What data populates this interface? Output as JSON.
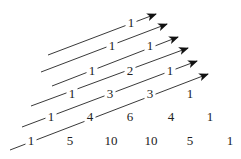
{
  "rows": [
    {
      "row": 0,
      "values": [
        "1"
      ]
    },
    {
      "row": 1,
      "values": [
        "1",
        "1"
      ]
    },
    {
      "row": 2,
      "values": [
        "1",
        "2",
        "1"
      ]
    },
    {
      "row": 3,
      "values": [
        "1",
        "3",
        "3",
        "1"
      ]
    },
    {
      "row": 4,
      "values": [
        "1",
        "4",
        "6",
        "4",
        "1"
      ]
    },
    {
      "row": 5,
      "values": [
        "1",
        "5",
        "10",
        "10",
        "5",
        "1"
      ]
    }
  ],
  "numbers": [
    {
      "label": "1",
      "x": 131,
      "y": 27
    },
    {
      "label": "1",
      "x": 112,
      "y": 50
    },
    {
      "label": "1",
      "x": 150,
      "y": 50
    },
    {
      "label": "1",
      "x": 92,
      "y": 75
    },
    {
      "label": "2",
      "x": 130,
      "y": 75
    },
    {
      "label": "1",
      "x": 170,
      "y": 75
    },
    {
      "label": "1",
      "x": 72,
      "y": 98
    },
    {
      "label": "3",
      "x": 110,
      "y": 98
    },
    {
      "label": "3",
      "x": 150,
      "y": 98
    },
    {
      "label": "1",
      "x": 190,
      "y": 98
    },
    {
      "label": "1",
      "x": 51,
      "y": 121
    },
    {
      "label": "4",
      "x": 90,
      "y": 121
    },
    {
      "label": "6",
      "x": 130,
      "y": 121
    },
    {
      "label": "4",
      "x": 171,
      "y": 121
    },
    {
      "label": "1",
      "x": 210,
      "y": 121
    },
    {
      "label": "1",
      "x": 31,
      "y": 145
    },
    {
      "label": "5",
      "x": 70,
      "y": 145
    },
    {
      "label": "10",
      "x": 111,
      "y": 145
    },
    {
      "label": "10",
      "x": 151,
      "y": 145
    },
    {
      "label": "5",
      "x": 190,
      "y": 145
    },
    {
      "label": "1",
      "x": 230,
      "y": 145
    }
  ],
  "diagonals": [
    {
      "x1": 48,
      "y1": 55,
      "x2": 156,
      "y2": 14
    },
    {
      "x1": 41,
      "y1": 72,
      "x2": 167,
      "y2": 24
    },
    {
      "x1": 52,
      "y1": 86,
      "x2": 178,
      "y2": 37
    },
    {
      "x1": 31,
      "y1": 106,
      "x2": 188,
      "y2": 48
    },
    {
      "x1": 22,
      "y1": 127,
      "x2": 197,
      "y2": 61
    },
    {
      "x1": 10,
      "y1": 150,
      "x2": 208,
      "y2": 74
    }
  ]
}
